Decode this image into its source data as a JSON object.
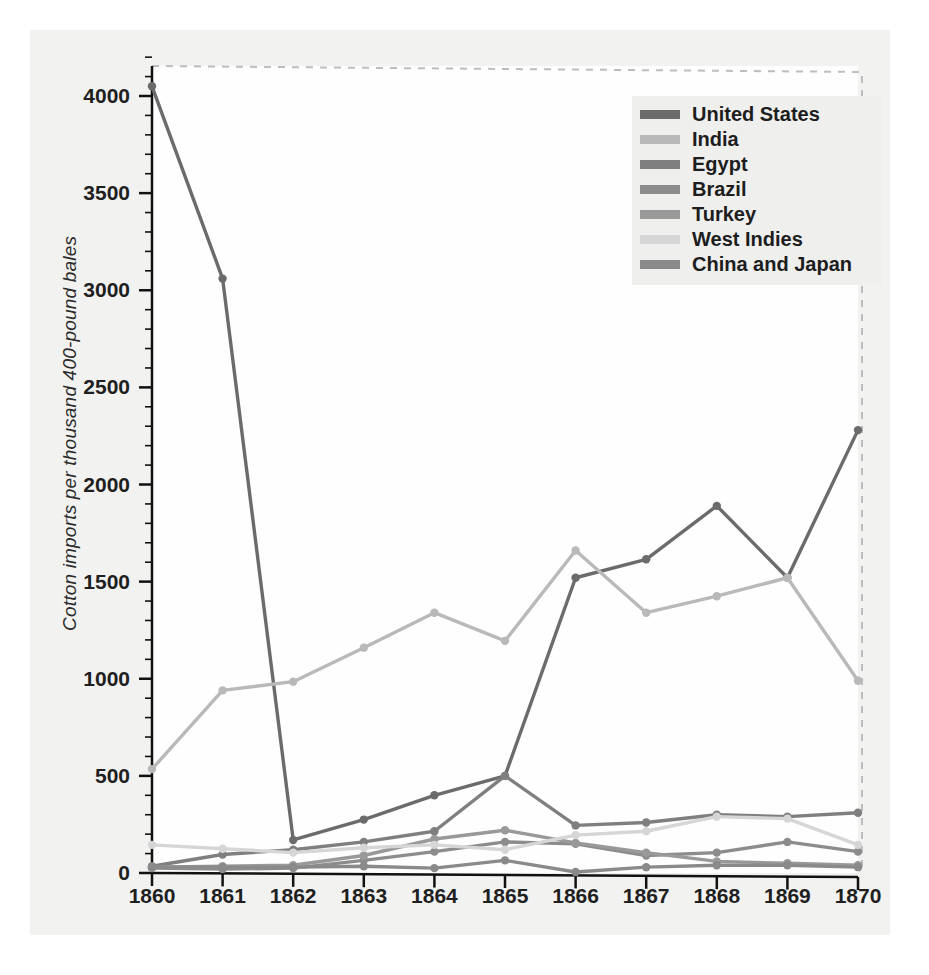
{
  "figure": {
    "background_color": "#f2f2f1",
    "plot_background_color": "#fefefe",
    "axis_color": "#111111",
    "frame_style": "dashed-top-right"
  },
  "axes": {
    "ylabel": "Cotton imports per thousand 400-pound bales",
    "xlabel": "",
    "yticks": [
      0,
      500,
      1000,
      1500,
      2000,
      2500,
      3000,
      3500,
      4000
    ],
    "ytick_labels": [
      "0",
      "500",
      "1000",
      "1500",
      "2000",
      "2500",
      "3000",
      "3500",
      "4000"
    ],
    "xticks": [
      1860,
      1861,
      1862,
      1863,
      1864,
      1865,
      1866,
      1867,
      1868,
      1869,
      1870
    ],
    "xtick_labels": [
      "1860",
      "1861",
      "1862",
      "1863",
      "1864",
      "1865",
      "1866",
      "1867",
      "1868",
      "1869",
      "1870"
    ],
    "ylim": [
      0,
      4200
    ],
    "xlim": [
      1860,
      1870
    ],
    "minor_ticks": true,
    "grid": false
  },
  "legend": {
    "position": "upper-right",
    "entries": [
      {
        "label": "United States",
        "color": "#6b6b6b"
      },
      {
        "label": "India",
        "color": "#b9b9b9"
      },
      {
        "label": "Egypt",
        "color": "#7f7f7f"
      },
      {
        "label": "Brazil",
        "color": "#8c8c8c"
      },
      {
        "label": "Turkey",
        "color": "#999999"
      },
      {
        "label": "West Indies",
        "color": "#d6d6d6"
      },
      {
        "label": "China and Japan",
        "color": "#8a8a8a"
      }
    ]
  },
  "chart_data": {
    "type": "line",
    "title": "",
    "xlabel": "",
    "ylabel": "Cotton imports per thousand 400-pound bales",
    "x": [
      1860,
      1861,
      1862,
      1863,
      1864,
      1865,
      1866,
      1867,
      1868,
      1869,
      1870
    ],
    "xlim": [
      1860,
      1870
    ],
    "ylim": [
      0,
      4200
    ],
    "grid": false,
    "legend_position": "upper-right",
    "markers": true,
    "series": [
      {
        "name": "United States",
        "color": "#6b6b6b",
        "values": [
          4050,
          3060,
          170,
          275,
          400,
          500,
          1520,
          1615,
          1890,
          1520,
          2280
        ]
      },
      {
        "name": "India",
        "color": "#b9b9b9",
        "values": [
          535,
          940,
          985,
          1160,
          1340,
          1195,
          1660,
          1340,
          1425,
          1520,
          990
        ]
      },
      {
        "name": "Egypt",
        "color": "#7f7f7f",
        "values": [
          35,
          95,
          120,
          160,
          215,
          500,
          245,
          260,
          300,
          290,
          310
        ]
      },
      {
        "name": "Brazil",
        "color": "#8c8c8c",
        "values": [
          25,
          20,
          25,
          65,
          110,
          160,
          150,
          90,
          105,
          160,
          110
        ]
      },
      {
        "name": "Turkey",
        "color": "#999999",
        "values": [
          30,
          35,
          40,
          90,
          175,
          220,
          155,
          105,
          60,
          50,
          40
        ]
      },
      {
        "name": "West Indies",
        "color": "#d6d6d6",
        "values": [
          145,
          125,
          105,
          130,
          145,
          120,
          195,
          215,
          290,
          280,
          145
        ]
      },
      {
        "name": "China and Japan",
        "color": "#8a8a8a",
        "values": [
          30,
          30,
          30,
          35,
          25,
          65,
          5,
          30,
          40,
          40,
          30
        ]
      }
    ]
  }
}
